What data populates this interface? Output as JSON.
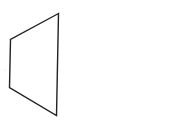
{
  "diagram": {
    "type": "line-drawing",
    "shape": "quadrilateral",
    "stroke_color": "#222222",
    "fill_color": "#ffffff",
    "stroke_width": 1.4,
    "vertices": [
      {
        "name": "top-right",
        "x": 58.5,
        "y": 13.5
      },
      {
        "name": "top-left",
        "x": 10.5,
        "y": 39.5
      },
      {
        "name": "bottom-left",
        "x": 9.5,
        "y": 87.5
      },
      {
        "name": "bottom-right",
        "x": 56.5,
        "y": 115.5
      }
    ],
    "points": "58.5,13.5 10.5,39.5 9.5,87.5 56.5,115.5"
  }
}
